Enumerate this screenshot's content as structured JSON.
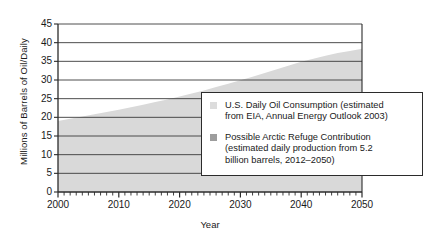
{
  "chart_data": {
    "type": "area",
    "title": "",
    "xlabel": "Year",
    "ylabel": "Millions of Barrels of Oil/Daily",
    "xlim": [
      2000,
      2050
    ],
    "ylim": [
      0,
      45
    ],
    "ytick_labels": [
      "0",
      "5",
      "10",
      "15",
      "20",
      "25",
      "30",
      "35",
      "40",
      "45"
    ],
    "ytick_values": [
      0,
      5,
      10,
      15,
      20,
      25,
      30,
      35,
      40,
      45
    ],
    "xtick_labels": [
      "2000",
      "2010",
      "2020",
      "2030",
      "2040",
      "2050"
    ],
    "xtick_values": [
      2000,
      2010,
      2020,
      2030,
      2040,
      2050
    ],
    "x_minor_tick_step": 1,
    "grid": "horizontal",
    "legend_position": "inside-right",
    "series": [
      {
        "name": "U.S. Daily Oil Consumption (estimated from EIA, Annual Energy Outlook 2003)",
        "color": "#d9d9d9",
        "x": [
          2000,
          2002,
          2004,
          2006,
          2008,
          2010,
          2012,
          2014,
          2016,
          2018,
          2020,
          2022,
          2024,
          2026,
          2028,
          2030,
          2032,
          2034,
          2036,
          2038,
          2040,
          2042,
          2044,
          2046,
          2048,
          2050
        ],
        "values": [
          19.0,
          19.6,
          20.2,
          20.8,
          21.4,
          22.0,
          22.7,
          23.4,
          24.1,
          24.8,
          25.6,
          26.4,
          27.2,
          28.1,
          29.0,
          29.9,
          30.9,
          31.9,
          32.9,
          33.9,
          34.9,
          35.7,
          36.5,
          37.2,
          37.8,
          38.4
        ]
      },
      {
        "name": "Possible Arctic Refuge Contribution (estimated daily production from 5.2 billion barrels, 2012–2050)",
        "color": "#9a9a9a",
        "x": [
          2012,
          2020,
          2030,
          2040,
          2050
        ],
        "values": [
          0.0,
          0.0,
          0.0,
          0.0,
          0.0
        ]
      }
    ]
  },
  "legend": {
    "items": [
      {
        "swatch_color": "#dcdcdc",
        "line1": "U.S. Daily Oil Consumption (estimated",
        "line2": "from EIA, Annual Energy Outlook 2003)"
      },
      {
        "swatch_color": "#9d9d9d",
        "line1": "Possible Arctic Refuge Contribution",
        "line2": "(estimated daily production from 5.2",
        "line3": "billion barrels, 2012–2050)"
      }
    ]
  },
  "colors": {
    "axis": "#2b2b2b",
    "grid": "#3a3a3a",
    "area_fill": "#d9d9d9",
    "plot_bg": "#ffffff"
  }
}
